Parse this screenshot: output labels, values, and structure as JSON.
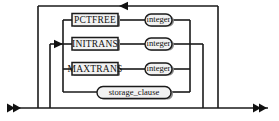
{
  "diagram": {
    "type": "railroad-syntax-diagram",
    "background_color": "#ffffff",
    "line_color": "#1a1a1a",
    "box_fill_color": "#f2f2f2",
    "box_shadow_color": "#808080",
    "entry_marker": "▶▶",
    "exit_marker": "◀◀",
    "loopback_marker": "◀",
    "branch_marker": "▶",
    "terminals": [
      {
        "id": "pctfree",
        "label": "PCTFREE",
        "shape": "rectangle",
        "row": 1
      },
      {
        "id": "initrans",
        "label": "INITRANS",
        "shape": "rectangle",
        "row": 2
      },
      {
        "id": "maxtrans",
        "label": "MAXTRANS",
        "shape": "rectangle",
        "row": 3
      }
    ],
    "nonterminals": [
      {
        "id": "integer-1",
        "label": "integer",
        "shape": "rounded",
        "row": 1
      },
      {
        "id": "integer-2",
        "label": "integer",
        "shape": "rounded",
        "row": 2
      },
      {
        "id": "integer-3",
        "label": "integer",
        "shape": "rounded",
        "row": 3
      },
      {
        "id": "storage-clause",
        "label": "storage_clause",
        "shape": "rounded",
        "row": 4
      }
    ],
    "rows": [
      {
        "index": 1,
        "keyword": "PCTFREE",
        "argument": "integer"
      },
      {
        "index": 2,
        "keyword": "INITRANS",
        "argument": "integer"
      },
      {
        "index": 3,
        "keyword": "MAXTRANS",
        "argument": "integer"
      },
      {
        "index": 4,
        "keyword": "",
        "argument": "storage_clause"
      }
    ]
  }
}
